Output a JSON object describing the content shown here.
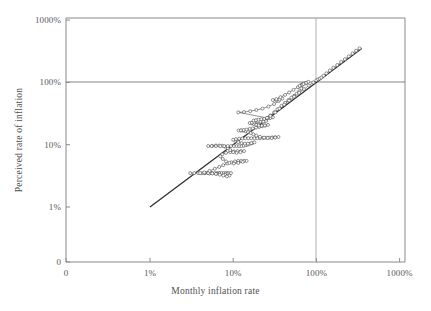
{
  "chart_data": {
    "type": "scatter",
    "title": "",
    "xlabel": "Monthly inflation rate",
    "ylabel": "Perceived rate of inflation",
    "xscale": "log",
    "yscale": "log",
    "xlim": [
      1,
      1000
    ],
    "ylim": [
      1,
      1000
    ],
    "x_tick_labels": [
      "0",
      "1%",
      "10%",
      "100%",
      "1000%"
    ],
    "x_tick_values": [
      0,
      1,
      10,
      100,
      1000
    ],
    "y_tick_labels": [
      "0",
      "1%",
      "10%",
      "100%",
      "1000%"
    ],
    "y_tick_values": [
      0,
      1,
      10,
      100,
      1000
    ],
    "grid": true,
    "gridlines": {
      "vertical_at": [
        100
      ],
      "horizontal_at": [
        100
      ]
    },
    "legend": null,
    "annotations": [],
    "series": [
      {
        "name": "45-degree reference line",
        "style": "solid-line",
        "marker": "none",
        "color": "#303030",
        "points": [
          [
            1,
            1
          ],
          [
            350,
            350
          ]
        ]
      },
      {
        "name": "Perceived vs monthly inflation path",
        "style": "connected-open-circles",
        "marker": "open-circle",
        "color": "#3a3a3a",
        "points": [
          [
            3.05,
            3.5
          ],
          [
            3.4,
            3.5
          ],
          [
            3.8,
            3.5
          ],
          [
            4.2,
            3.48
          ],
          [
            4.6,
            3.5
          ],
          [
            5.0,
            3.5
          ],
          [
            5.4,
            3.5
          ],
          [
            5.2,
            3.45
          ],
          [
            5.6,
            3.5
          ],
          [
            6.0,
            3.5
          ],
          [
            6.4,
            3.5
          ],
          [
            6.8,
            3.5
          ],
          [
            6.3,
            3.4
          ],
          [
            6.9,
            3.5
          ],
          [
            7.3,
            3.5
          ],
          [
            7.7,
            3.5
          ],
          [
            8.1,
            3.5
          ],
          [
            8.5,
            3.5
          ],
          [
            8.0,
            3.3
          ],
          [
            8.6,
            3.45
          ],
          [
            9.0,
            3.5
          ],
          [
            9.4,
            3.5
          ],
          [
            9.0,
            3.2
          ],
          [
            8.4,
            3.1
          ],
          [
            7.6,
            3.2
          ],
          [
            6.9,
            3.3
          ],
          [
            6.2,
            3.4
          ],
          [
            5.6,
            3.45
          ],
          [
            5.0,
            3.5
          ],
          [
            4.5,
            3.5
          ],
          [
            4.0,
            3.5
          ],
          [
            4.5,
            3.6
          ],
          [
            5.2,
            3.8
          ],
          [
            6.0,
            4.1
          ],
          [
            6.8,
            4.4
          ],
          [
            7.6,
            4.7
          ],
          [
            8.5,
            5.0
          ],
          [
            9.5,
            5.2
          ],
          [
            10.5,
            5.4
          ],
          [
            11.5,
            5.5
          ],
          [
            12.5,
            5.5
          ],
          [
            13.5,
            5.5
          ],
          [
            14.5,
            5.5
          ],
          [
            13.0,
            5.3
          ],
          [
            11.5,
            5.1
          ],
          [
            10.2,
            5.0
          ],
          [
            9.0,
            5.1
          ],
          [
            8.2,
            5.4
          ],
          [
            7.5,
            5.9
          ],
          [
            7.0,
            6.5
          ],
          [
            7.4,
            7.0
          ],
          [
            8.2,
            7.4
          ],
          [
            9.2,
            7.6
          ],
          [
            10.2,
            7.8
          ],
          [
            11.3,
            7.9
          ],
          [
            12.4,
            7.9
          ],
          [
            13.5,
            7.9
          ],
          [
            12.2,
            7.6
          ],
          [
            11.0,
            7.4
          ],
          [
            10.0,
            7.6
          ],
          [
            9.2,
            8.2
          ],
          [
            8.6,
            8.8
          ],
          [
            8.0,
            9.3
          ],
          [
            7.4,
            9.6
          ],
          [
            6.8,
            9.7
          ],
          [
            6.2,
            9.7
          ],
          [
            5.6,
            9.6
          ],
          [
            5.0,
            9.5
          ],
          [
            5.5,
            9.5
          ],
          [
            6.2,
            9.5
          ],
          [
            7.0,
            9.5
          ],
          [
            7.8,
            9.5
          ],
          [
            8.6,
            9.5
          ],
          [
            9.4,
            9.5
          ],
          [
            10.2,
            9.5
          ],
          [
            11.0,
            9.5
          ],
          [
            11.8,
            9.5
          ],
          [
            12.6,
            9.5
          ],
          [
            13.4,
            9.6
          ],
          [
            14.2,
            9.8
          ],
          [
            15.0,
            10.0
          ],
          [
            16.0,
            10.3
          ],
          [
            17.0,
            10.6
          ],
          [
            18.0,
            10.9
          ],
          [
            16.5,
            10.6
          ],
          [
            15.0,
            10.4
          ],
          [
            13.8,
            10.4
          ],
          [
            12.6,
            10.6
          ],
          [
            11.5,
            11.0
          ],
          [
            10.6,
            11.5
          ],
          [
            10.0,
            12.0
          ],
          [
            10.8,
            12.3
          ],
          [
            11.8,
            12.5
          ],
          [
            12.9,
            12.6
          ],
          [
            14.0,
            12.7
          ],
          [
            15.2,
            12.7
          ],
          [
            16.5,
            12.7
          ],
          [
            18.0,
            12.7
          ],
          [
            19.5,
            12.7
          ],
          [
            21.0,
            12.7
          ],
          [
            23.0,
            12.8
          ],
          [
            25.0,
            12.9
          ],
          [
            27.0,
            13.0
          ],
          [
            29.5,
            13.1
          ],
          [
            32.0,
            13.2
          ],
          [
            35.0,
            13.3
          ],
          [
            32.0,
            13.0
          ],
          [
            29.0,
            12.8
          ],
          [
            26.0,
            12.8
          ],
          [
            23.5,
            13.0
          ],
          [
            21.0,
            13.4
          ],
          [
            19.0,
            14.0
          ],
          [
            17.5,
            14.7
          ],
          [
            16.2,
            15.4
          ],
          [
            15.0,
            16.0
          ],
          [
            14.0,
            16.5
          ],
          [
            13.2,
            16.8
          ],
          [
            12.4,
            16.9
          ],
          [
            11.6,
            16.9
          ],
          [
            12.4,
            17.0
          ],
          [
            13.4,
            17.2
          ],
          [
            14.5,
            17.5
          ],
          [
            15.8,
            17.9
          ],
          [
            17.2,
            18.3
          ],
          [
            18.8,
            18.8
          ],
          [
            20.5,
            19.3
          ],
          [
            22.3,
            19.8
          ],
          [
            24.2,
            20.3
          ],
          [
            26.2,
            20.8
          ],
          [
            24.0,
            20.4
          ],
          [
            22.0,
            20.2
          ],
          [
            20.2,
            20.4
          ],
          [
            18.8,
            20.9
          ],
          [
            17.6,
            21.5
          ],
          [
            16.6,
            22.0
          ],
          [
            15.8,
            22.3
          ],
          [
            16.8,
            22.5
          ],
          [
            18.0,
            22.7
          ],
          [
            19.4,
            22.9
          ],
          [
            21.0,
            23.2
          ],
          [
            22.8,
            23.6
          ],
          [
            24.8,
            24.0
          ],
          [
            23.0,
            23.6
          ],
          [
            21.2,
            23.4
          ],
          [
            19.8,
            23.6
          ],
          [
            18.6,
            24.0
          ],
          [
            17.6,
            24.4
          ],
          [
            18.8,
            24.8
          ],
          [
            20.2,
            25.2
          ],
          [
            21.8,
            25.6
          ],
          [
            23.6,
            26.0
          ],
          [
            25.6,
            26.5
          ],
          [
            27.8,
            27.0
          ],
          [
            30.0,
            27.5
          ],
          [
            28.0,
            27.0
          ],
          [
            26.0,
            26.8
          ],
          [
            11.5,
            33.0
          ],
          [
            13.5,
            33.5
          ],
          [
            16.0,
            34.5
          ],
          [
            19.0,
            36.0
          ],
          [
            22.5,
            38.0
          ],
          [
            26.5,
            41.0
          ],
          [
            31.0,
            45.0
          ],
          [
            35.0,
            50.0
          ],
          [
            39.0,
            55.0
          ],
          [
            36.0,
            53.0
          ],
          [
            33.0,
            52.0
          ],
          [
            30.0,
            52.0
          ],
          [
            33.0,
            54.0
          ],
          [
            37.0,
            58.0
          ],
          [
            42.0,
            63.0
          ],
          [
            47.0,
            69.0
          ],
          [
            53.0,
            76.0
          ],
          [
            60.0,
            84.0
          ],
          [
            68.0,
            93.0
          ],
          [
            66.0,
            91.0
          ],
          [
            63.0,
            88.0
          ],
          [
            68.0,
            92.0
          ],
          [
            74.0,
            97.0
          ],
          [
            80.0,
            102.0
          ],
          [
            75.0,
            98.0
          ],
          [
            70.0,
            94.0
          ],
          [
            66.0,
            80.0
          ],
          [
            62.0,
            72.0
          ],
          [
            58.0,
            66.0
          ],
          [
            54.0,
            61.0
          ],
          [
            50.0,
            57.0
          ],
          [
            46.0,
            52.0
          ],
          [
            42.0,
            47.0
          ],
          [
            38.0,
            42.0
          ],
          [
            34.0,
            37.0
          ],
          [
            31.0,
            33.0
          ],
          [
            28.0,
            29.5
          ],
          [
            25.5,
            27.0
          ],
          [
            28.0,
            29.0
          ],
          [
            32.0,
            33.0
          ],
          [
            36.0,
            38.0
          ],
          [
            41.0,
            44.0
          ],
          [
            47.0,
            51.0
          ],
          [
            54.0,
            59.0
          ],
          [
            62.0,
            68.0
          ],
          [
            71.0,
            78.0
          ],
          [
            81.0,
            89.0
          ],
          [
            92.0,
            100.0
          ],
          [
            100.0,
            108.0
          ],
          [
            105.0,
            112.0
          ],
          [
            110.0,
            115.0
          ],
          [
            115.0,
            120.0
          ],
          [
            122.0,
            128.0
          ],
          [
            132.0,
            140.0
          ],
          [
            145.0,
            155.0
          ],
          [
            160.0,
            172.0
          ],
          [
            178.0,
            190.0
          ],
          [
            198.0,
            212.0
          ],
          [
            220.0,
            236.0
          ],
          [
            245.0,
            262.0
          ],
          [
            272.0,
            292.0
          ],
          [
            300.0,
            322.0
          ],
          [
            330.0,
            352.0
          ]
        ]
      }
    ]
  },
  "axes": {
    "x_title": "Monthly inflation rate",
    "y_title": "Perceived rate of inflation",
    "x_ticks": [
      {
        "label": "0",
        "value": 0
      },
      {
        "label": "1%",
        "value": 1
      },
      {
        "label": "10%",
        "value": 10
      },
      {
        "label": "100%",
        "value": 100
      },
      {
        "label": "1000%",
        "value": 1000
      }
    ],
    "y_ticks": [
      {
        "label": "0",
        "value": 0
      },
      {
        "label": "1%",
        "value": 1
      },
      {
        "label": "10%",
        "value": 10
      },
      {
        "label": "100%",
        "value": 100
      },
      {
        "label": "1000%",
        "value": 1000
      }
    ]
  },
  "colors": {
    "background": "#ffffff",
    "axis": "#8a8a8a",
    "gridline": "#a6a6a6",
    "data": "#3a3a3a",
    "reference_line": "#303030",
    "text": "#4f4f4f"
  }
}
